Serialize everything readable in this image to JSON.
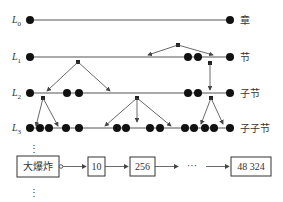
{
  "levels": [
    {
      "label": "L",
      "sub": "0",
      "name": "章"
    },
    {
      "label": "L",
      "sub": "1",
      "name": "节"
    },
    {
      "label": "L",
      "sub": "2",
      "name": "子节"
    },
    {
      "label": "L",
      "sub": "3",
      "name": "子子节"
    }
  ],
  "chain": {
    "start": "大爆炸",
    "nodes": [
      "10",
      "256",
      "48 324"
    ],
    "ellipsis": "···",
    "vertical_ellipsis": "⋮"
  },
  "colors": {
    "line": "#555555",
    "dot": "#111111",
    "box_border": "#333333"
  }
}
